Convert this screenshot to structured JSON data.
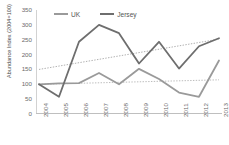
{
  "chart_data": {
    "type": "line",
    "title": "",
    "xlabel": "",
    "ylabel": "Abundance Index (2004=100)",
    "categories": [
      "2004",
      "2005",
      "2006",
      "2007",
      "2008",
      "2009",
      "2010",
      "2011",
      "2012",
      "2013"
    ],
    "ylim": [
      0,
      350
    ],
    "yticks": [
      350,
      300,
      250,
      200,
      150,
      100,
      50,
      0
    ],
    "grid": false,
    "legend_position": "top",
    "series": [
      {
        "name": "UK",
        "color": "#9a9a9a",
        "values": [
          100,
          103,
          104,
          138,
          100,
          152,
          118,
          72,
          58,
          180
        ]
      },
      {
        "name": "Jersey",
        "color": "#6e6e6e",
        "values": [
          100,
          58,
          243,
          300,
          272,
          170,
          243,
          153,
          228,
          255
        ]
      }
    ],
    "trendlines": [
      {
        "name": "UK trendline",
        "color": "#bdbdbd",
        "style": "dotted",
        "start_value": 100,
        "end_value": 115
      },
      {
        "name": "Jersey trendline",
        "color": "#b0b0b0",
        "style": "dotted",
        "start_value": 150,
        "end_value": 252
      }
    ]
  },
  "legend": {
    "items": [
      {
        "label": "UK"
      },
      {
        "label": "Jersey"
      }
    ]
  },
  "axis": {
    "y_label": "Abundance Index (2004=100)",
    "y_ticks": [
      "350",
      "300",
      "250",
      "200",
      "150",
      "100",
      "50",
      "0"
    ],
    "x_ticks": [
      "2004",
      "2005",
      "2006",
      "2007",
      "2008",
      "2009",
      "2010",
      "2011",
      "2012",
      "2013"
    ]
  }
}
